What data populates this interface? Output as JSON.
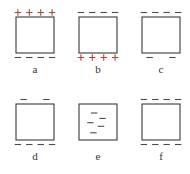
{
  "figure": {
    "colors": {
      "positive": "#b5473a",
      "negative": "#4a4a55",
      "outline": "#3a3a3a"
    },
    "panels": [
      {
        "id": "a",
        "label": "a",
        "top": {
          "sign": "+",
          "count": 4
        },
        "bottom": {
          "sign": "-",
          "count": 4
        },
        "inside": 0
      },
      {
        "id": "b",
        "label": "b",
        "top": {
          "sign": "-",
          "count": 4
        },
        "bottom": {
          "sign": "+",
          "count": 4
        },
        "inside": 0
      },
      {
        "id": "c",
        "label": "c",
        "top": {
          "sign": "-",
          "count": 4
        },
        "bottom": {
          "sign": "-",
          "count": 2
        },
        "inside": 0
      },
      {
        "id": "d",
        "label": "d",
        "top": {
          "sign": "-",
          "count": 2
        },
        "bottom": {
          "sign": "-",
          "count": 4
        },
        "inside": 0
      },
      {
        "id": "e",
        "label": "e",
        "top": {
          "sign": "",
          "count": 0
        },
        "bottom": {
          "sign": "",
          "count": 0
        },
        "inside": 5
      },
      {
        "id": "f",
        "label": "f",
        "top": {
          "sign": "-",
          "count": 4
        },
        "bottom": {
          "sign": "-",
          "count": 4
        },
        "inside": 0
      }
    ]
  }
}
